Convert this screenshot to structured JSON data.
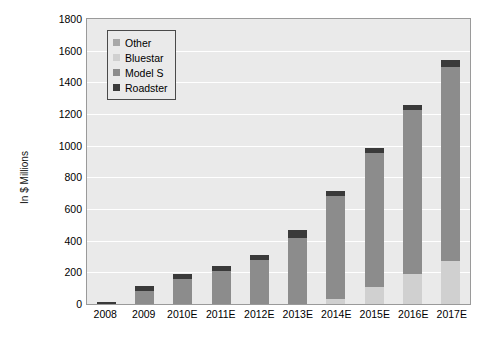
{
  "chart_data": {
    "type": "bar",
    "stacked": true,
    "title": "",
    "xlabel": "",
    "ylabel": "In $ Millions",
    "ylim": [
      0,
      1800
    ],
    "ytick_step": 200,
    "yticks": [
      "1800",
      "1600",
      "1400",
      "1200",
      "1000",
      "800",
      "600",
      "400",
      "200",
      "0"
    ],
    "grid": true,
    "grid_axis": "y",
    "legend_position": "top-left",
    "categories": [
      "2008",
      "2009",
      "2010E",
      "2011E",
      "2012E",
      "2013E",
      "2014E",
      "2015E",
      "2016E",
      "2017E"
    ],
    "series": [
      {
        "name": "Other",
        "color": "#a8a8a8",
        "values": [
          0,
          0,
          0,
          0,
          0,
          0,
          0,
          0,
          0,
          0
        ]
      },
      {
        "name": "Bluestar",
        "color": "#d0d0d0",
        "values": [
          0,
          0,
          0,
          0,
          0,
          0,
          30,
          110,
          190,
          270
        ]
      },
      {
        "name": "Model S",
        "color": "#8c8c8c",
        "values": [
          0,
          85,
          160,
          210,
          280,
          420,
          650,
          845,
          1035,
          1230
        ]
      },
      {
        "name": "Roadster",
        "color": "#3a3a3a",
        "values": [
          15,
          30,
          30,
          30,
          30,
          45,
          35,
          30,
          35,
          40
        ]
      }
    ],
    "totals": [
      15,
      115,
      190,
      240,
      310,
      465,
      715,
      985,
      1260,
      1540
    ]
  },
  "legend": {
    "items": [
      {
        "label": "Other",
        "color": "#a8a8a8"
      },
      {
        "label": "Bluestar",
        "color": "#d0d0d0"
      },
      {
        "label": "Model S",
        "color": "#8c8c8c"
      },
      {
        "label": "Roadster",
        "color": "#3a3a3a"
      }
    ]
  },
  "style": {
    "plot_background": "#eaeaea",
    "gridline_color": "#ffffff",
    "frame_color": "#9a9a9a",
    "text_color": "#000000"
  }
}
